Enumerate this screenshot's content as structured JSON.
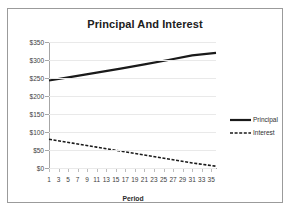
{
  "chart_data": {
    "type": "line",
    "title": "Principal And Interest",
    "xlabel": "Period",
    "ylabel": "",
    "xlim": [
      1,
      36
    ],
    "ylim": [
      0,
      350
    ],
    "grid": true,
    "legend_position": "right",
    "y_ticks": [
      "$0",
      "$50",
      "$100",
      "$150",
      "$200",
      "$250",
      "$300",
      "$350"
    ],
    "y_tick_values": [
      0,
      50,
      100,
      150,
      200,
      250,
      300,
      350
    ],
    "x_ticks": [
      1,
      3,
      5,
      7,
      9,
      11,
      13,
      15,
      17,
      19,
      21,
      23,
      25,
      27,
      29,
      31,
      33,
      35
    ],
    "x": [
      1,
      6,
      11,
      16,
      21,
      26,
      31,
      36
    ],
    "series": [
      {
        "name": "Principal",
        "style": "solid",
        "color": "#1a1a1a",
        "values": [
          243,
          254,
          265,
          276,
          288,
          300,
          313,
          320
        ]
      },
      {
        "name": "Interest",
        "style": "dashed",
        "color": "#1a1a1a",
        "values": [
          80,
          69,
          58,
          47,
          36,
          25,
          14,
          5
        ]
      }
    ],
    "colors": {
      "border": "#9b9b9b",
      "axis": "#a6a6a6",
      "gridline": "#e9e9e9",
      "text": "#404040",
      "title": "#202020",
      "background": "#ffffff"
    }
  }
}
